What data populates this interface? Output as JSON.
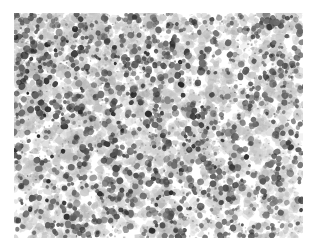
{
  "figure": {
    "domain": "Natural-Image",
    "kind": "histopathology-micrograph",
    "description": "Grayscale light-microscopy field of densely packed small cells; pale gray cytoplasm and stroma with numerous dark round nuclei scattered throughout.",
    "stain_appearance": "grayscale / desaturated hematoxylin-like",
    "has_caption": false,
    "has_scale_bar": false,
    "has_annotations": false,
    "has_border": false
  },
  "canvas": {
    "page_width": 318,
    "page_height": 251,
    "image_left": 14,
    "image_top": 13,
    "image_width": 289,
    "image_height": 225,
    "margin_color": "#ffffff"
  },
  "palette": {
    "background": "#ffffff",
    "page_margin": "#ffffff",
    "stroma_light": "#d8d8d8",
    "stroma_mid": "#b4b4b4",
    "cytoplasm_gray": "#9a9a9a",
    "nucleus_mid": "#6b6b6b",
    "nucleus_dark": "#3a3a3a",
    "nucleus_darkest": "#1a1a1a"
  },
  "texture": {
    "seed": 20240517,
    "pale_clusters": 2600,
    "pale_radius_min": 2.0,
    "pale_radius_max": 5.2,
    "dark_nuclei": 1350,
    "nucleus_radius_min": 1.6,
    "nucleus_radius_max": 3.6,
    "speckles": 1700,
    "density_gradient": "dense at upper-left and center, sparser toward lower-right",
    "density_top_left": 1.0,
    "density_bottom_right": 0.55,
    "blur_px": 0.35
  }
}
